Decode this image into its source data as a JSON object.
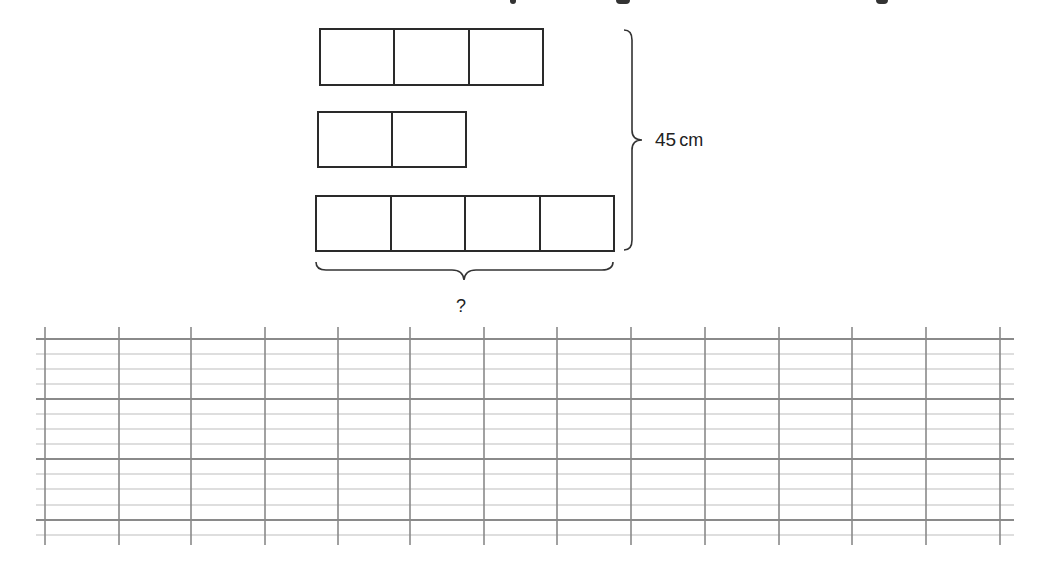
{
  "heading_fragment": {
    "visible": "cut off at top edge — only descender marks visible",
    "marks_x": [
      480,
      620,
      880
    ]
  },
  "diagram": {
    "bars": [
      {
        "name": "bar-3-squares",
        "cells": 3,
        "x": 319,
        "y": 28,
        "w": 225,
        "h": 58
      },
      {
        "name": "bar-2-squares",
        "cells": 2,
        "x": 317,
        "y": 111,
        "w": 150,
        "h": 57
      },
      {
        "name": "bar-4-squares",
        "cells": 4,
        "x": 315,
        "y": 195,
        "w": 300,
        "h": 57
      }
    ],
    "height_label": "45 cm",
    "height_value": "45",
    "height_unit": "cm",
    "width_label": "?"
  },
  "grid": {
    "x_start": 36,
    "x_end": 1014,
    "vertical_lines_x": [
      45,
      119,
      191,
      265,
      338,
      410,
      484,
      557,
      631,
      705,
      779,
      852,
      926,
      1000
    ],
    "vertical_top": 327,
    "vertical_bottom": 545,
    "thick_lines_y": [
      339,
      399,
      459,
      520
    ],
    "thin_lines_y": [
      354,
      369,
      384,
      414,
      429,
      444,
      474,
      489,
      505,
      535
    ],
    "colors": {
      "thick": "#8a8a8a",
      "thin": "#bdbdbd",
      "vertical": "#8a8a8a"
    }
  }
}
